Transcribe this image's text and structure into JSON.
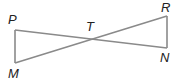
{
  "diagram": {
    "type": "geometry",
    "colors": {
      "line": "#8a8a8a",
      "label": "#222222",
      "background": "#ffffff"
    },
    "points": {
      "P": {
        "label": "P",
        "x": 15,
        "y": 30
      },
      "M": {
        "label": "M",
        "x": 15,
        "y": 63
      },
      "T": {
        "label": "T",
        "x": 90,
        "y": 38
      },
      "R": {
        "label": "R",
        "x": 167,
        "y": 16
      },
      "N": {
        "label": "N",
        "x": 167,
        "y": 48
      }
    },
    "segments": [
      {
        "from": "P",
        "to": "M"
      },
      {
        "from": "P",
        "to": "N"
      },
      {
        "from": "M",
        "to": "R"
      },
      {
        "from": "R",
        "to": "N"
      }
    ]
  }
}
